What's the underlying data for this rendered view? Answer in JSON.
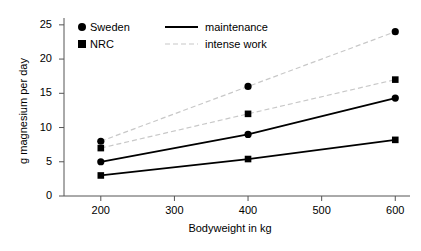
{
  "chart_data": {
    "type": "line",
    "title": "",
    "xlabel": "Bodyweight in kg",
    "ylabel": "g magnesium per day",
    "x": [
      200,
      400,
      600
    ],
    "xlim": [
      150,
      620
    ],
    "ylim": [
      0,
      26
    ],
    "xticks": [
      200,
      300,
      400,
      500,
      600
    ],
    "yticks": [
      0,
      5,
      10,
      15,
      20,
      25
    ],
    "grid": false,
    "legend_position": "top-left-inside",
    "series": [
      {
        "name": "Sweden intense work",
        "source": "Sweden",
        "condition": "intense work",
        "marker": "circle",
        "line_style": "dashed",
        "color": "#c8c8c8",
        "marker_color": "#000000",
        "values": [
          8,
          16,
          24
        ]
      },
      {
        "name": "NRC intense work",
        "source": "NRC",
        "condition": "intense work",
        "marker": "square",
        "line_style": "dashed",
        "color": "#c8c8c8",
        "marker_color": "#000000",
        "values": [
          7,
          12,
          17
        ]
      },
      {
        "name": "Sweden maintenance",
        "source": "Sweden",
        "condition": "maintenance",
        "marker": "circle",
        "line_style": "solid",
        "color": "#000000",
        "marker_color": "#000000",
        "values": [
          5,
          9,
          14.3
        ]
      },
      {
        "name": "NRC maintenance",
        "source": "NRC",
        "condition": "maintenance",
        "marker": "square",
        "line_style": "solid",
        "color": "#000000",
        "marker_color": "#000000",
        "values": [
          3,
          5.4,
          8.2
        ]
      }
    ],
    "legend": {
      "marker_entries": [
        {
          "label": "Sweden",
          "marker": "circle"
        },
        {
          "label": "NRC",
          "marker": "square"
        }
      ],
      "line_entries": [
        {
          "label": "maintenance",
          "line_style": "solid",
          "color": "#000000"
        },
        {
          "label": "intense work",
          "line_style": "dashed",
          "color": "#c8c8c8"
        }
      ]
    },
    "ytick_labels": [
      "0",
      "5",
      "10",
      "15",
      "20",
      "25"
    ],
    "xtick_labels": [
      "200",
      "300",
      "400",
      "500",
      "600"
    ]
  }
}
